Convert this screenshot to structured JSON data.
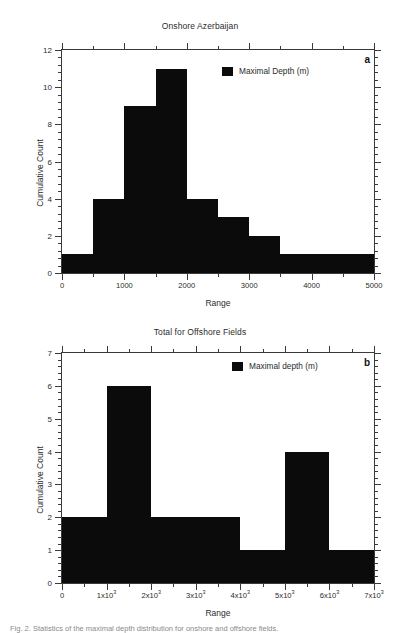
{
  "figure": {
    "caption": "Fig. 2. Statistics of the maximal depth distribution for onshore and offshore fields."
  },
  "chart_data": [
    {
      "id": "a",
      "type": "bar",
      "title": "Onshore Azerbaijan",
      "panel_letter": "a",
      "xlabel": "Range",
      "ylabel": "Cumulative Count",
      "legend": {
        "label": "Maximal Depth (m)",
        "color": "#0b0b0b",
        "position": "top-right-inside"
      },
      "xlim": [
        0,
        5000
      ],
      "ylim": [
        0,
        12
      ],
      "x_major_ticks": [
        0,
        1000,
        2000,
        3000,
        4000,
        5000
      ],
      "x_major_tick_labels": [
        "0",
        "1000",
        "2000",
        "3000",
        "4000",
        "5000"
      ],
      "x_minor_tick_interval": 500,
      "y_major_ticks": [
        0,
        2,
        4,
        6,
        8,
        10,
        12
      ],
      "y_major_tick_labels": [
        "0",
        "2",
        "4",
        "6",
        "8",
        "10",
        "12"
      ],
      "y_minor_tick_interval": 0.5,
      "grid": false,
      "bins": [
        {
          "x0": 0,
          "x1": 500,
          "value": 1
        },
        {
          "x0": 500,
          "x1": 1000,
          "value": 4
        },
        {
          "x0": 1000,
          "x1": 1500,
          "value": 9
        },
        {
          "x0": 1500,
          "x1": 2000,
          "value": 11
        },
        {
          "x0": 2000,
          "x1": 2500,
          "value": 4
        },
        {
          "x0": 2500,
          "x1": 3000,
          "value": 3
        },
        {
          "x0": 3000,
          "x1": 3500,
          "value": 2
        },
        {
          "x0": 3500,
          "x1": 5000,
          "value": 1
        }
      ]
    },
    {
      "id": "b",
      "type": "bar",
      "title": "Total for Offshore Fields",
      "panel_letter": "b",
      "xlabel": "Range",
      "ylabel": "Cumulative Count",
      "legend": {
        "label": "Maximal depth (m)",
        "color": "#0b0b0b",
        "position": "top-right-inside"
      },
      "xlim": [
        0,
        7000
      ],
      "ylim": [
        0,
        7
      ],
      "x_major_ticks": [
        0,
        1000,
        2000,
        3000,
        4000,
        5000,
        6000,
        7000
      ],
      "x_major_tick_labels": [
        "0",
        "1x10|3",
        "2x10|3",
        "3x10|3",
        "4x10|3",
        "5x10|3",
        "6x10|3",
        "7x10|3"
      ],
      "x_minor_tick_interval": 500,
      "y_major_ticks": [
        0,
        1,
        2,
        3,
        4,
        5,
        6,
        7
      ],
      "y_major_tick_labels": [
        "0",
        "1",
        "2",
        "3",
        "4",
        "5",
        "6",
        "7"
      ],
      "y_minor_tick_interval": 0.2,
      "grid": false,
      "bins": [
        {
          "x0": 0,
          "x1": 1000,
          "value": 2
        },
        {
          "x0": 1000,
          "x1": 2000,
          "value": 6
        },
        {
          "x0": 2000,
          "x1": 4000,
          "value": 2
        },
        {
          "x0": 4000,
          "x1": 5000,
          "value": 1
        },
        {
          "x0": 5000,
          "x1": 6000,
          "value": 4
        },
        {
          "x0": 6000,
          "x1": 7000,
          "value": 1
        }
      ]
    }
  ]
}
